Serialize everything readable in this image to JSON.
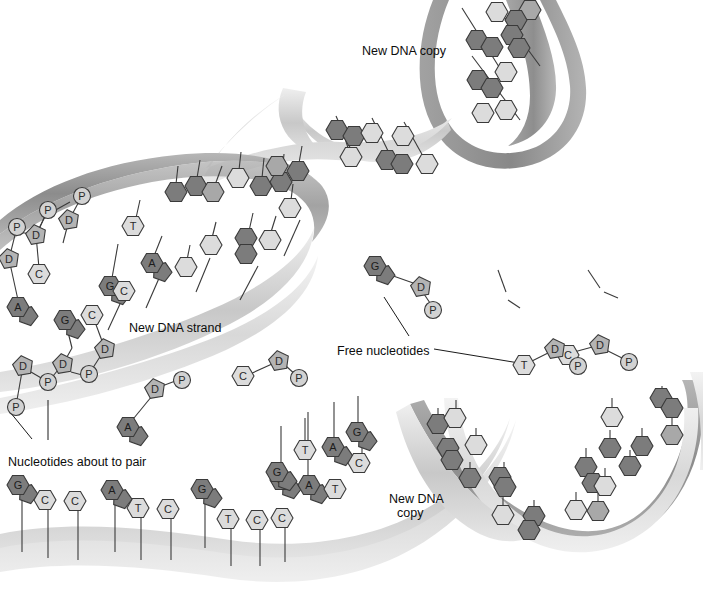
{
  "figure": {
    "background_color": "#ffffff"
  },
  "palette": {
    "base_dark": "#7c7c7c",
    "base_mid": "#a8a8a8",
    "base_light": "#dcdcdc",
    "base_lighter": "#ececec",
    "sugar": "#b4b4b4",
    "phosphate": "#d2d2d2",
    "ribbon_dark": "#8c8c8c",
    "ribbon_light": "#c8c8c8",
    "ribbon_pale": "#dedede",
    "outline": "#3a3a3a",
    "text": "#0d0d0d"
  },
  "labels": [
    {
      "id": "new-dna-copy-top",
      "text": "New DNA copy",
      "x": 362,
      "y": 44
    },
    {
      "id": "new-dna-strand",
      "text": "New DNA strand",
      "x": 129,
      "y": 321
    },
    {
      "id": "free-nucleotides",
      "text": "Free nucleotides",
      "x": 337,
      "y": 344
    },
    {
      "id": "nucleotides-about-to-pair",
      "text": "Nucleotides about to pair",
      "x": 8,
      "y": 455
    },
    {
      "id": "new-dna-copy-bottom-line1",
      "text": "New DNA",
      "x": 389,
      "y": 492
    },
    {
      "id": "new-dna-copy-bottom-line2",
      "text": "copy",
      "x": 397,
      "y": 506
    }
  ],
  "leader_lines": [
    {
      "id": "leader-free-nucleotides-left",
      "x1": 409,
      "y1": 336,
      "x2": 384,
      "y2": 297
    },
    {
      "id": "leader-free-nucleotides-right",
      "x1": 434,
      "y1": 349,
      "x2": 519,
      "y2": 363
    },
    {
      "id": "leader-pairing-diag",
      "x1": 10,
      "y1": 412,
      "x2": 32,
      "y2": 439
    },
    {
      "id": "leader-pairing-vert",
      "x1": 48,
      "y1": 400,
      "x2": 48,
      "y2": 440
    }
  ],
  "labeled_bases": {
    "new_strand_backbone": [
      {
        "sym": "P",
        "kind": "phosphate",
        "x": 17,
        "y": 227
      },
      {
        "sym": "D",
        "kind": "sugar",
        "x": 9,
        "y": 259
      },
      {
        "sym": "A",
        "kind": "base-dark",
        "x": 18,
        "y": 307
      },
      {
        "sym": "P",
        "kind": "phosphate",
        "x": 48,
        "y": 210
      },
      {
        "sym": "D",
        "kind": "sugar",
        "x": 36,
        "y": 235
      },
      {
        "sym": "C",
        "kind": "base-light",
        "x": 39,
        "y": 274
      },
      {
        "sym": "P",
        "kind": "phosphate",
        "x": 82,
        "y": 196
      },
      {
        "sym": "D",
        "kind": "sugar",
        "x": 69,
        "y": 220
      },
      {
        "sym": "G",
        "kind": "base-dark",
        "x": 65,
        "y": 320
      },
      {
        "sym": "C",
        "kind": "base-light",
        "x": 92,
        "y": 315
      },
      {
        "sym": "D",
        "kind": "sugar",
        "x": 105,
        "y": 349
      },
      {
        "sym": "P",
        "kind": "phosphate",
        "x": 89,
        "y": 374
      },
      {
        "sym": "D",
        "kind": "sugar",
        "x": 63,
        "y": 364
      },
      {
        "sym": "P",
        "kind": "phosphate",
        "x": 48,
        "y": 382
      },
      {
        "sym": "D",
        "kind": "sugar",
        "x": 23,
        "y": 366
      },
      {
        "sym": "P",
        "kind": "phosphate",
        "x": 16,
        "y": 407
      }
    ],
    "new_strand_bases": [
      {
        "sym": "G",
        "kind": "base-dark",
        "x": 110,
        "y": 286
      },
      {
        "sym": "T",
        "kind": "base-light",
        "x": 133,
        "y": 226
      },
      {
        "sym": "A",
        "kind": "base-dark",
        "x": 152,
        "y": 263
      },
      {
        "sym": "C",
        "kind": "base-light",
        "x": 124,
        "y": 291
      }
    ],
    "template_bottom": [
      {
        "sym": "G",
        "kind": "base-dark",
        "x": 18,
        "y": 485
      },
      {
        "sym": "C",
        "kind": "base-light",
        "x": 45,
        "y": 500
      },
      {
        "sym": "C",
        "kind": "base-light",
        "x": 75,
        "y": 501
      },
      {
        "sym": "A",
        "kind": "base-dark",
        "x": 112,
        "y": 490
      },
      {
        "sym": "T",
        "kind": "base-light",
        "x": 138,
        "y": 508
      },
      {
        "sym": "C",
        "kind": "base-light",
        "x": 168,
        "y": 509
      },
      {
        "sym": "G",
        "kind": "base-dark",
        "x": 202,
        "y": 489
      },
      {
        "sym": "T",
        "kind": "base-light",
        "x": 228,
        "y": 519
      },
      {
        "sym": "C",
        "kind": "base-light",
        "x": 257,
        "y": 520
      },
      {
        "sym": "C",
        "kind": "base-light",
        "x": 282,
        "y": 518
      }
    ],
    "pairing_zone": [
      {
        "sym": "G",
        "kind": "base-dark",
        "x": 281,
        "y": 480
      },
      {
        "sym": "A",
        "kind": "base-dark",
        "x": 309,
        "y": 485
      },
      {
        "sym": "T",
        "kind": "base-light",
        "x": 335,
        "y": 489
      },
      {
        "sym": "T",
        "kind": "base-light",
        "x": 305,
        "y": 450
      },
      {
        "sym": "A",
        "kind": "base-dark",
        "x": 333,
        "y": 447
      },
      {
        "sym": "G",
        "kind": "base-dark",
        "x": 357,
        "y": 432
      },
      {
        "sym": "C",
        "kind": "base-light",
        "x": 359,
        "y": 463
      },
      {
        "sym": "G",
        "kind": "base-dark",
        "x": 277,
        "y": 472
      }
    ],
    "free_nucleotides": [
      {
        "sym": "A",
        "kind": "base-dark",
        "x": 128,
        "y": 427
      },
      {
        "sym": "D",
        "kind": "sugar",
        "x": 155,
        "y": 389
      },
      {
        "sym": "P",
        "kind": "phosphate",
        "x": 182,
        "y": 380
      },
      {
        "sym": "C",
        "kind": "base-light",
        "x": 243,
        "y": 376
      },
      {
        "sym": "D",
        "kind": "sugar",
        "x": 279,
        "y": 361
      },
      {
        "sym": "P",
        "kind": "phosphate",
        "x": 299,
        "y": 378
      },
      {
        "sym": "G",
        "kind": "base-dark",
        "x": 375,
        "y": 266
      },
      {
        "sym": "D",
        "kind": "sugar",
        "x": 421,
        "y": 287
      },
      {
        "sym": "P",
        "kind": "phosphate",
        "x": 433,
        "y": 310
      },
      {
        "sym": "C",
        "kind": "base-light",
        "x": 568,
        "y": 355
      },
      {
        "sym": "D",
        "kind": "sugar",
        "x": 600,
        "y": 345
      },
      {
        "sym": "P",
        "kind": "phosphate",
        "x": 629,
        "y": 362
      },
      {
        "sym": "T",
        "kind": "base-light",
        "x": 524,
        "y": 365
      },
      {
        "sym": "D",
        "kind": "sugar",
        "x": 555,
        "y": 349
      },
      {
        "sym": "P",
        "kind": "phosphate",
        "x": 578,
        "y": 366
      }
    ]
  },
  "unlabeled_bases": {
    "note": "hexagonal base blobs without letters, drawn on new DNA copies and helix regions",
    "new_strand_upper": [
      {
        "x": 176,
        "y": 192,
        "kind": "base-dark"
      },
      {
        "x": 196,
        "y": 186,
        "kind": "base-dark"
      },
      {
        "x": 213,
        "y": 192,
        "kind": "base-mid"
      },
      {
        "x": 238,
        "y": 178,
        "kind": "base-light"
      },
      {
        "x": 261,
        "y": 186,
        "kind": "base-dark"
      },
      {
        "x": 281,
        "y": 182,
        "kind": "base-dark"
      },
      {
        "x": 298,
        "y": 171,
        "kind": "base-dark"
      },
      {
        "x": 277,
        "y": 166,
        "kind": "base-mid"
      },
      {
        "x": 290,
        "y": 208,
        "kind": "base-light"
      },
      {
        "x": 246,
        "y": 238,
        "kind": "base-dark"
      },
      {
        "x": 246,
        "y": 254,
        "kind": "base-dark"
      },
      {
        "x": 270,
        "y": 240,
        "kind": "base-light"
      },
      {
        "x": 211,
        "y": 245,
        "kind": "base-light"
      },
      {
        "x": 186,
        "y": 267,
        "kind": "base-light"
      }
    ],
    "copy_top": [
      {
        "x": 497,
        "y": 12,
        "kind": "base-light"
      },
      {
        "x": 530,
        "y": 10,
        "kind": "base-mid"
      },
      {
        "x": 516,
        "y": 20,
        "kind": "base-dark"
      },
      {
        "x": 477,
        "y": 40,
        "kind": "base-dark"
      },
      {
        "x": 492,
        "y": 47,
        "kind": "base-dark"
      },
      {
        "x": 512,
        "y": 35,
        "kind": "base-dark"
      },
      {
        "x": 519,
        "y": 48,
        "kind": "base-dark"
      },
      {
        "x": 506,
        "y": 72,
        "kind": "base-light"
      },
      {
        "x": 478,
        "y": 80,
        "kind": "base-dark"
      },
      {
        "x": 492,
        "y": 88,
        "kind": "base-dark"
      },
      {
        "x": 483,
        "y": 113,
        "kind": "base-light"
      },
      {
        "x": 506,
        "y": 110,
        "kind": "base-light"
      }
    ],
    "copy_mid": [
      {
        "x": 337,
        "y": 130,
        "kind": "base-dark"
      },
      {
        "x": 354,
        "y": 136,
        "kind": "base-dark"
      },
      {
        "x": 372,
        "y": 133,
        "kind": "base-light"
      },
      {
        "x": 403,
        "y": 136,
        "kind": "base-light"
      },
      {
        "x": 351,
        "y": 157,
        "kind": "base-light"
      },
      {
        "x": 387,
        "y": 160,
        "kind": "base-dark"
      },
      {
        "x": 402,
        "y": 164,
        "kind": "base-dark"
      },
      {
        "x": 427,
        "y": 164,
        "kind": "base-light"
      }
    ],
    "helix_bottom_left": [
      {
        "x": 438,
        "y": 424,
        "kind": "base-dark"
      },
      {
        "x": 455,
        "y": 418,
        "kind": "base-light"
      },
      {
        "x": 448,
        "y": 448,
        "kind": "base-dark"
      },
      {
        "x": 452,
        "y": 460,
        "kind": "base-dark"
      },
      {
        "x": 476,
        "y": 445,
        "kind": "base-light"
      },
      {
        "x": 470,
        "y": 478,
        "kind": "base-dark"
      },
      {
        "x": 500,
        "y": 477,
        "kind": "base-dark"
      },
      {
        "x": 505,
        "y": 487,
        "kind": "base-dark"
      },
      {
        "x": 503,
        "y": 515,
        "kind": "base-light"
      },
      {
        "x": 534,
        "y": 516,
        "kind": "base-dark"
      },
      {
        "x": 529,
        "y": 530,
        "kind": "base-dark"
      }
    ],
    "helix_bottom_right": [
      {
        "x": 612,
        "y": 417,
        "kind": "base-light"
      },
      {
        "x": 661,
        "y": 398,
        "kind": "base-dark"
      },
      {
        "x": 672,
        "y": 408,
        "kind": "base-dark"
      },
      {
        "x": 610,
        "y": 448,
        "kind": "base-dark"
      },
      {
        "x": 642,
        "y": 446,
        "kind": "base-dark"
      },
      {
        "x": 630,
        "y": 466,
        "kind": "base-dark"
      },
      {
        "x": 672,
        "y": 435,
        "kind": "base-mid"
      },
      {
        "x": 586,
        "y": 467,
        "kind": "base-dark"
      },
      {
        "x": 593,
        "y": 483,
        "kind": "base-dark"
      },
      {
        "x": 605,
        "y": 486,
        "kind": "base-light"
      },
      {
        "x": 576,
        "y": 510,
        "kind": "base-light"
      },
      {
        "x": 598,
        "y": 511,
        "kind": "base-mid"
      }
    ]
  }
}
